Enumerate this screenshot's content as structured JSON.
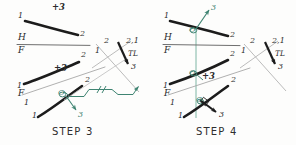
{
  "page": {
    "background_color": "#fdfdfc",
    "ink_color": "#1c1c1c",
    "light_ink_color": "#9a9a9a",
    "construction_color": "#3f8472"
  },
  "panels": [
    {
      "id": "step3",
      "step_label": "STEP  3",
      "labels": {
        "top_line_start": "1",
        "top_line_end": "2",
        "top_plus_three": "+3",
        "h_label": "H",
        "f_label": "F",
        "front_line_start": "1",
        "front_line_end": "2",
        "front_plus_three": "+3",
        "f_small": "F",
        "f_sub_one": "1",
        "aux_line_start": "1",
        "aux_line_end": "2",
        "aux_point_o": "O",
        "aux_point_three": "3",
        "tl_top_label": "2,1",
        "tl_label": "TL",
        "tl_end_label": "3",
        "edge_two": "2",
        "edge_one": "1",
        "edge_two_lower": "2"
      }
    },
    {
      "id": "step4",
      "step_label": "STEP  4",
      "labels": {
        "top_line_start": "1",
        "top_line_end": "2",
        "top_point_o": "O",
        "top_point_three": "3",
        "h_label": "H",
        "f_label": "F",
        "front_line_start": "1",
        "front_line_end": "2",
        "front_point_o": "O",
        "front_plus_three": "+3",
        "f_small": "F",
        "f_sub_one": "1",
        "aux_line_start": "1",
        "aux_line_end": "2",
        "aux_point_o": "O",
        "aux_point_three": "3",
        "tl_top_label": "2,1",
        "tl_label": "TL",
        "tl_end_label": "3",
        "edge_two": "2",
        "edge_one": "1"
      }
    }
  ]
}
